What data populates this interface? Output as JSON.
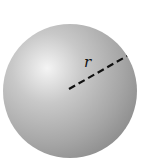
{
  "figure": {
    "type": "sphere-radius-diagram",
    "label": "r",
    "colors": {
      "background": "#ffffff",
      "sphere_highlight": "#f2f2f2",
      "sphere_mid": "#b4b4b4",
      "sphere_shadow": "#8a8a8a",
      "radius_line": "#111111"
    },
    "sphere": {
      "cx": 70,
      "cy": 91,
      "r": 67
    },
    "radius_line": {
      "x1": 69,
      "y1": 89,
      "x2": 127,
      "y2": 56,
      "style": "dashed"
    }
  }
}
